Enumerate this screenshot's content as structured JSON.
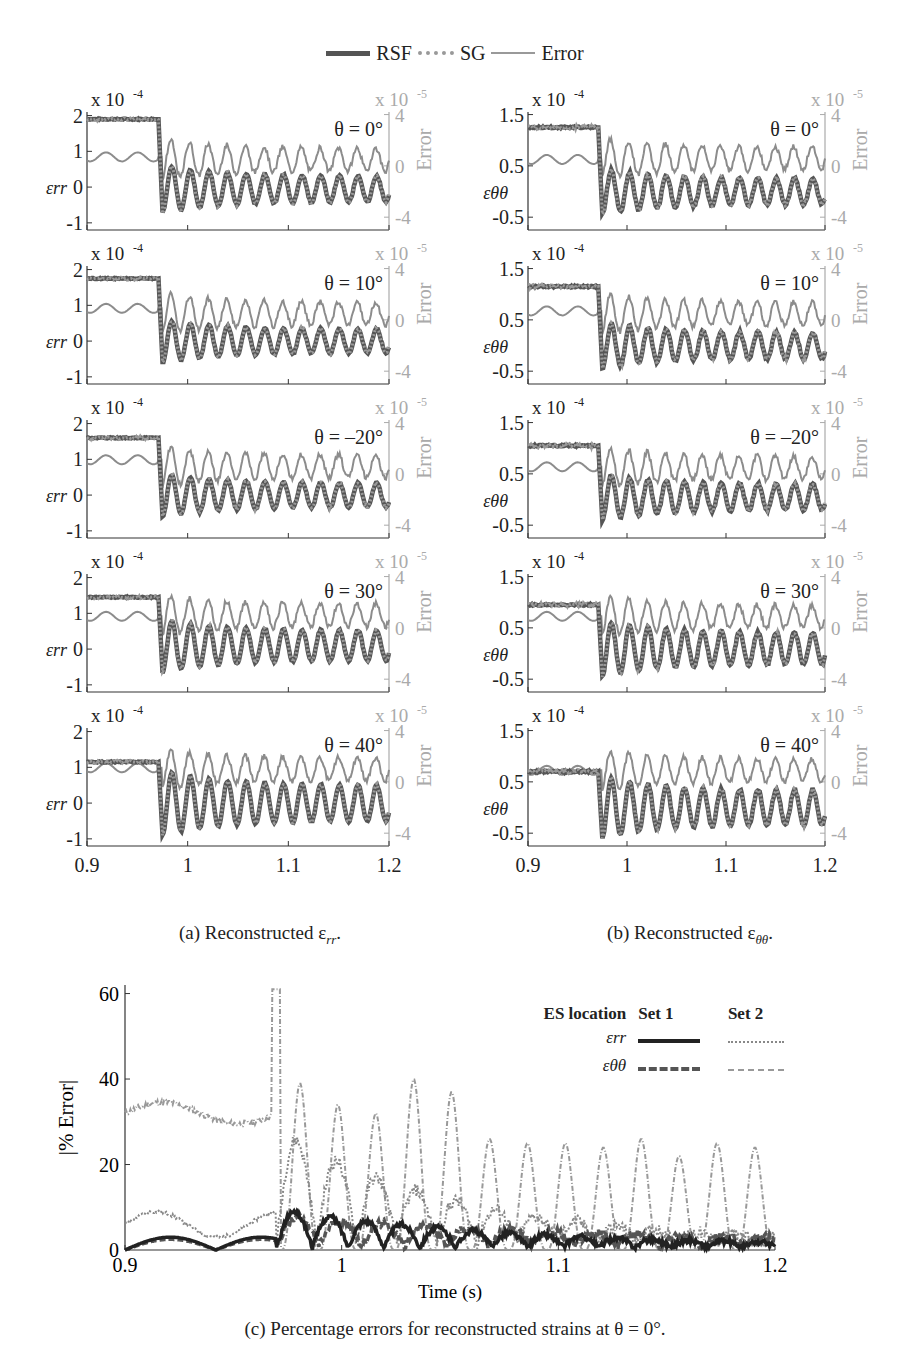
{
  "legend": {
    "rsf": "RSF",
    "sg": "SG",
    "error": "Error"
  },
  "captions": {
    "a": "(a) Reconstructed ε",
    "a_sub": "rr",
    "b": "(b) Reconstructed ε",
    "b_sub": "θθ",
    "c": "(c) Percentage errors for reconstructed strains at  θ = 0°."
  },
  "colors": {
    "rsf": "#555555",
    "sg": "#9a9a9a",
    "error": "#8c8c8c",
    "axis": "#333333",
    "right_axis": "#aaaaaa",
    "set1": "#222222",
    "set2": "#888888"
  },
  "chart_data": [
    {
      "type": "line",
      "title": "(a) Reconstructed εrr",
      "xlabel": "",
      "x_ticks": [
        0.9,
        1,
        1.1,
        1.2
      ],
      "xlim": [
        0.9,
        1.2
      ],
      "ylabel": "εrr",
      "y_multiplier": "x 10^-4",
      "ylim": [
        -1.2,
        2.1
      ],
      "y_ticks": [
        -1,
        0,
        1,
        2
      ],
      "y2label": "Error",
      "y2_multiplier": "x 10^-5",
      "y2lim": [
        -5,
        4.2
      ],
      "y2_ticks": [
        -4,
        0,
        4
      ],
      "series": [
        "RSF",
        "SG",
        "Error"
      ],
      "panels": [
        {
          "theta": "θ = 0°",
          "pre_event_rsf": 1.9,
          "pre_event_error": 0.7,
          "event_time": 0.975,
          "osc_amp": 0.65,
          "osc_center": -0.05,
          "err_center": 0.5
        },
        {
          "theta": "θ = 10°",
          "pre_event_rsf": 1.75,
          "pre_event_error": 0.9,
          "event_time": 0.975,
          "osc_amp": 0.6,
          "osc_center": 0.0,
          "err_center": 0.5
        },
        {
          "theta": "θ = –20°",
          "pre_event_rsf": 1.6,
          "pre_event_error": 1.1,
          "event_time": 0.975,
          "osc_amp": 0.6,
          "osc_center": 0.0,
          "err_center": 0.6
        },
        {
          "theta": "θ = 30°",
          "pre_event_rsf": 1.45,
          "pre_event_error": 0.9,
          "event_time": 0.975,
          "osc_amp": 0.75,
          "osc_center": 0.1,
          "err_center": 1.0
        },
        {
          "theta": "θ = 40°",
          "pre_event_rsf": 1.15,
          "pre_event_error": 1.1,
          "event_time": 0.975,
          "osc_amp": 0.9,
          "osc_center": 0.0,
          "err_center": 1.0
        }
      ]
    },
    {
      "type": "line",
      "title": "(b) Reconstructed εθθ",
      "xlabel": "",
      "x_ticks": [
        0.9,
        1,
        1.1,
        1.2
      ],
      "xlim": [
        0.9,
        1.2
      ],
      "ylabel": "εθθ",
      "y_multiplier": "x 10^-4",
      "ylim": [
        -0.75,
        1.55
      ],
      "y_ticks": [
        -0.5,
        0.5,
        1.5
      ],
      "y2label": "Error",
      "y2_multiplier": "x 10^-5",
      "y2lim": [
        -5,
        4.2
      ],
      "y2_ticks": [
        -4,
        0,
        4
      ],
      "series": [
        "RSF",
        "SG",
        "Error"
      ],
      "panels": [
        {
          "theta": "θ = 0°",
          "pre_event_rsf": 1.25,
          "pre_event_error": 0.5,
          "event_time": 0.975,
          "osc_amp": 0.45,
          "osc_center": 0.0,
          "err_center": 0.6
        },
        {
          "theta": "θ = 10°",
          "pre_event_rsf": 1.15,
          "pre_event_error": 0.7,
          "event_time": 0.975,
          "osc_amp": 0.45,
          "osc_center": 0.0,
          "err_center": 0.5
        },
        {
          "theta": "θ = –20°",
          "pre_event_rsf": 1.05,
          "pre_event_error": 0.55,
          "event_time": 0.975,
          "osc_amp": 0.45,
          "osc_center": 0.05,
          "err_center": 0.5
        },
        {
          "theta": "θ = 30°",
          "pre_event_rsf": 0.95,
          "pre_event_error": 0.9,
          "event_time": 0.975,
          "osc_amp": 0.55,
          "osc_center": 0.1,
          "err_center": 0.9
        },
        {
          "theta": "θ = 40°",
          "pre_event_rsf": 0.7,
          "pre_event_error": 0.9,
          "event_time": 0.975,
          "osc_amp": 0.6,
          "osc_center": 0.0,
          "err_center": 0.9
        }
      ]
    },
    {
      "type": "line",
      "title": "(c) Percentage errors for reconstructed strains at θ = 0°",
      "xlabel": "Time (s)",
      "ylabel": "|% Error|",
      "xlim": [
        0.9,
        1.2
      ],
      "x_ticks": [
        0.9,
        1,
        1.1,
        1.2
      ],
      "ylim": [
        0,
        62
      ],
      "y_ticks": [
        0,
        20,
        40,
        60
      ],
      "legend": {
        "header": [
          "ES location",
          "Set 1",
          "Set 2"
        ],
        "rows": [
          "εrr",
          "εθθ"
        ]
      },
      "series": [
        {
          "name": "Set 1 εrr",
          "style": "solid-thick",
          "baseline": 2,
          "peak": 9,
          "peak_time": 0.996
        },
        {
          "name": "Set 1 εθθ",
          "style": "dashed-thick",
          "baseline": 2,
          "peak": 14,
          "peak_time": 1.03
        },
        {
          "name": "Set 2 εrr",
          "style": "dotted",
          "baseline": 6,
          "pre_event_peak": 9,
          "peak": 27,
          "peak_time": 0.975
        },
        {
          "name": "Set 2 εθθ",
          "style": "dash-dot",
          "pre_event_level": 32,
          "peak": 61,
          "peak_time": 0.97,
          "post_peaks": [
            39,
            34,
            32,
            40,
            37,
            26,
            25,
            25,
            24,
            26,
            22,
            25,
            24
          ]
        }
      ]
    }
  ]
}
